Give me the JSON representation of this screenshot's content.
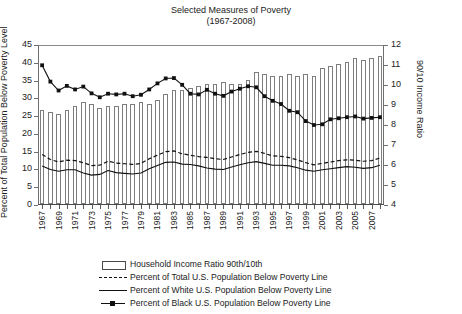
{
  "chart_data": {
    "type": "bar",
    "title": "Selected Measures of Poverty",
    "subtitle": "(1967-2008)",
    "xlabel": "",
    "ylabel": "Percent of Total Population Below Poverty Level",
    "y2label": "90/10 Income Ratio",
    "ylim": [
      0,
      45
    ],
    "y2lim": [
      4,
      12
    ],
    "yticks": [
      0,
      5,
      10,
      15,
      20,
      25,
      30,
      35,
      40,
      45
    ],
    "y2ticks": [
      4,
      5,
      6,
      7,
      8,
      9,
      10,
      11,
      12
    ],
    "grid": false,
    "legend_position": "bottom",
    "x": [
      1967,
      1968,
      1969,
      1970,
      1971,
      1972,
      1973,
      1974,
      1975,
      1976,
      1977,
      1978,
      1979,
      1980,
      1981,
      1982,
      1983,
      1984,
      1985,
      1986,
      1987,
      1988,
      1989,
      1990,
      1991,
      1992,
      1993,
      1994,
      1995,
      1996,
      1997,
      1998,
      1999,
      2000,
      2001,
      2002,
      2003,
      2004,
      2005,
      2006,
      2007,
      2008
    ],
    "xtick_labels": [
      "1967",
      "1969",
      "1971",
      "1973",
      "1975",
      "1977",
      "1979",
      "1981",
      "1983",
      "1985",
      "1987",
      "1989",
      "1991",
      "1993",
      "1995",
      "1997",
      "1999",
      "2001",
      "2003",
      "2005",
      "2007"
    ],
    "series": [
      {
        "name": "Household Income Ratio 90th/10th",
        "type": "bar",
        "axis": "right",
        "units": "ratio",
        "values": [
          8.7,
          8.6,
          8.5,
          8.7,
          8.9,
          9.1,
          9.0,
          8.8,
          8.9,
          8.9,
          9.0,
          9.0,
          9.1,
          9.0,
          9.2,
          9.5,
          9.7,
          9.7,
          9.8,
          9.9,
          10.0,
          10.0,
          10.1,
          10.0,
          10.0,
          10.2,
          10.6,
          10.5,
          10.4,
          10.4,
          10.5,
          10.4,
          10.5,
          10.4,
          10.8,
          10.9,
          11.0,
          11.1,
          11.3,
          11.2,
          11.3,
          11.4
        ]
      },
      {
        "name": "Percent of Total U.S. Population Below Poverty Line",
        "type": "line",
        "style": "dashed",
        "axis": "left",
        "units": "percent",
        "values": [
          14.2,
          12.8,
          12.1,
          12.6,
          12.5,
          11.9,
          11.1,
          11.2,
          12.3,
          11.8,
          11.6,
          11.4,
          11.7,
          13.0,
          14.0,
          15.0,
          15.2,
          14.4,
          14.0,
          13.6,
          13.4,
          13.0,
          12.8,
          13.5,
          14.2,
          14.8,
          15.1,
          14.5,
          13.8,
          13.7,
          13.3,
          12.7,
          11.9,
          11.3,
          11.7,
          12.1,
          12.5,
          12.7,
          12.6,
          12.3,
          12.5,
          13.2
        ]
      },
      {
        "name": "Percent of White U.S. Population Below Poverty Line",
        "type": "line",
        "style": "solid",
        "axis": "left",
        "units": "percent",
        "values": [
          11.0,
          10.0,
          9.5,
          9.9,
          9.9,
          9.0,
          8.4,
          8.6,
          9.7,
          9.1,
          8.9,
          8.7,
          9.0,
          10.2,
          11.1,
          12.0,
          12.1,
          11.5,
          11.4,
          11.0,
          10.4,
          10.1,
          10.0,
          10.7,
          11.3,
          11.9,
          12.2,
          11.7,
          11.2,
          11.2,
          11.0,
          10.5,
          9.8,
          9.5,
          9.9,
          10.2,
          10.5,
          10.8,
          10.6,
          10.3,
          10.5,
          11.2
        ]
      },
      {
        "name": "Percent of Black U.S. Population Below Poverty Line",
        "type": "line",
        "style": "solid-square",
        "axis": "left",
        "units": "percent",
        "values": [
          39.3,
          34.7,
          32.2,
          33.5,
          32.5,
          33.3,
          31.4,
          30.3,
          31.3,
          31.1,
          31.3,
          30.6,
          31.0,
          32.5,
          34.2,
          35.6,
          35.7,
          33.8,
          31.3,
          31.1,
          32.4,
          31.3,
          30.7,
          31.9,
          32.7,
          33.4,
          33.1,
          30.6,
          29.3,
          28.4,
          26.5,
          26.1,
          23.6,
          22.5,
          22.7,
          24.1,
          24.4,
          24.7,
          24.9,
          24.3,
          24.5,
          24.7
        ]
      }
    ]
  },
  "legend": {
    "items": [
      {
        "label": "Household Income Ratio 90th/10th",
        "marker": "bar-swatch"
      },
      {
        "label": "Percent of Total U.S. Population Below Poverty Line",
        "marker": "dashed-line"
      },
      {
        "label": "Percent of White U.S. Population Below Poverty Line",
        "marker": "solid-line"
      },
      {
        "label": "Percent of Black U.S. Population Below Poverty Line",
        "marker": "square-marker-line"
      }
    ]
  },
  "colors": {
    "bar_fill": "#ffffff",
    "bar_stroke": "#7d7d7d",
    "line": "#111111",
    "axis": "#6e6e6e",
    "text": "#1a1a1a"
  }
}
